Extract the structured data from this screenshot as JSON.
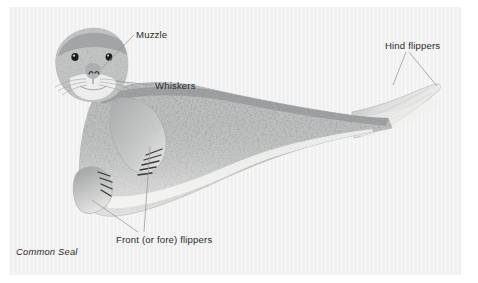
{
  "figure": {
    "caption": "Common Seal",
    "panel_color": "#f1f1f1",
    "page_color": "#ffffff",
    "label_color": "#2c2c2c",
    "leader_line_color": "#9a9a9a"
  },
  "labels": [
    {
      "id": "muzzle",
      "text": "Muzzle",
      "points_to": "snout-and-nostrils"
    },
    {
      "id": "whiskers",
      "text": "Whiskers",
      "points_to": "vibrissae-on-cheek"
    },
    {
      "id": "hind",
      "text": "Hind flippers",
      "points_to": "rear-flippers"
    },
    {
      "id": "front",
      "text": "Front (or fore) flippers",
      "points_to": "fore-flippers-with-claws"
    }
  ],
  "icons": {
    "leader_line": "leader-line",
    "seal": "seal-illustration"
  }
}
